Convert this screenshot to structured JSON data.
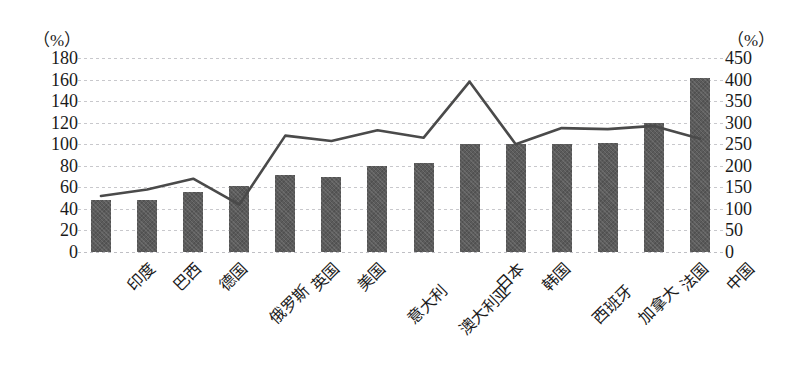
{
  "axes": {
    "left_unit": "（%）",
    "right_unit": "（%）",
    "left_ticks": [
      "180",
      "160",
      "140",
      "120",
      "100",
      "80",
      "60",
      "40",
      "20",
      "0"
    ],
    "right_ticks": [
      "450",
      "400",
      "350",
      "300",
      "250",
      "200",
      "150",
      "100",
      "50",
      "0"
    ]
  },
  "colors": {
    "bar": "#5b5b5b",
    "line": "#4a4a4a",
    "grid": "#c8c8cc",
    "background": "#ffffff",
    "text": "#1a1a1a"
  },
  "chart_data": {
    "type": "bar",
    "title": "",
    "subtitle": "",
    "xlabel": "",
    "ylabel": "（%）",
    "y2label": "（%）",
    "ylim": [
      0,
      180
    ],
    "y2lim": [
      0,
      450
    ],
    "grid": true,
    "legend": "none",
    "categories": [
      "印度",
      "巴西",
      "德国",
      "俄罗斯",
      "英国",
      "美国",
      "意大利",
      "澳大利亚",
      "日本",
      "韩国",
      "西班牙",
      "加拿大",
      "法国",
      "中国"
    ],
    "series": [
      {
        "name": "柱形系列",
        "type": "bar",
        "axis": "left",
        "values": [
          48,
          48,
          56,
          61,
          71,
          70,
          80,
          83,
          100,
          100,
          100,
          101,
          120,
          161
        ]
      },
      {
        "name": "折线系列",
        "type": "line",
        "axis": "right",
        "values": [
          130,
          145,
          170,
          110,
          270,
          258,
          283,
          265,
          395,
          250,
          288,
          285,
          293,
          263
        ],
        "values_left_scale": [
          52,
          58,
          68,
          44,
          108,
          103,
          113,
          106,
          158,
          100,
          115,
          114,
          117,
          105
        ]
      }
    ]
  }
}
